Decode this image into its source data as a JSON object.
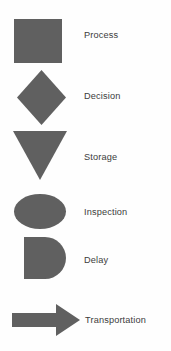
{
  "diagram": {
    "background_color": "#fefefe",
    "shape_fill_color": "#606060",
    "label_color": "#3c3c3c",
    "items": [
      {
        "shape": "square",
        "shape_icon_name": "process-square-shape",
        "label": "Process"
      },
      {
        "shape": "diamond",
        "shape_icon_name": "decision-diamond-shape",
        "label": "Decision"
      },
      {
        "shape": "inverted-triangle",
        "shape_icon_name": "storage-triangle-shape",
        "label": "Storage"
      },
      {
        "shape": "ellipse",
        "shape_icon_name": "inspection-ellipse-shape",
        "label": "Inspection"
      },
      {
        "shape": "d-shape",
        "shape_icon_name": "delay-d-shape",
        "label": "Delay"
      },
      {
        "shape": "right-arrow",
        "shape_icon_name": "transportation-arrow-shape",
        "label": "Transportation"
      }
    ]
  }
}
